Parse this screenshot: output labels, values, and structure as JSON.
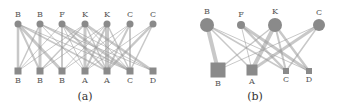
{
  "colors": {
    "node": "#8a8a8a",
    "edge": "#9a9a9a",
    "text": "#444444"
  },
  "panels": [
    {
      "id": "a",
      "caption": "(a)",
      "caption_pos": [
        85,
        100
      ],
      "top_nodes": [
        {
          "label": "B",
          "x": 18,
          "y": 24,
          "r": 3.5
        },
        {
          "label": "B",
          "x": 40,
          "y": 24,
          "r": 3.5
        },
        {
          "label": "F",
          "x": 62,
          "y": 24,
          "r": 3.5
        },
        {
          "label": "K",
          "x": 85,
          "y": 24,
          "r": 3.5
        },
        {
          "label": "K",
          "x": 107,
          "y": 24,
          "r": 3.5
        },
        {
          "label": "C",
          "x": 130,
          "y": 24,
          "r": 3.5
        },
        {
          "label": "C",
          "x": 153,
          "y": 24,
          "r": 3.5
        }
      ],
      "bottom_nodes": [
        {
          "label": "B",
          "x": 18,
          "y": 71,
          "s": 7
        },
        {
          "label": "B",
          "x": 40,
          "y": 71,
          "s": 7
        },
        {
          "label": "B",
          "x": 62,
          "y": 71,
          "s": 7
        },
        {
          "label": "A",
          "x": 85,
          "y": 71,
          "s": 7
        },
        {
          "label": "A",
          "x": 107,
          "y": 71,
          "s": 7
        },
        {
          "label": "C",
          "x": 130,
          "y": 71,
          "s": 7
        },
        {
          "label": "D",
          "x": 153,
          "y": 71,
          "s": 7
        }
      ],
      "edges": [
        [
          0,
          0,
          2.5
        ],
        [
          0,
          1,
          2
        ],
        [
          0,
          2,
          3
        ],
        [
          0,
          4,
          1.5
        ],
        [
          0,
          5,
          1
        ],
        [
          1,
          0,
          1.5
        ],
        [
          1,
          1,
          3
        ],
        [
          1,
          3,
          1
        ],
        [
          1,
          5,
          1.5
        ],
        [
          1,
          6,
          1
        ],
        [
          2,
          2,
          2
        ],
        [
          2,
          3,
          1
        ],
        [
          2,
          4,
          2
        ],
        [
          2,
          5,
          2.5
        ],
        [
          2,
          6,
          1
        ],
        [
          2,
          0,
          1
        ],
        [
          3,
          1,
          1.5
        ],
        [
          3,
          3,
          3
        ],
        [
          3,
          4,
          1.5
        ],
        [
          3,
          5,
          1
        ],
        [
          3,
          6,
          2.5
        ],
        [
          3,
          0,
          1
        ],
        [
          4,
          2,
          1
        ],
        [
          4,
          3,
          2
        ],
        [
          4,
          4,
          4
        ],
        [
          4,
          5,
          1.5
        ],
        [
          4,
          1,
          1
        ],
        [
          5,
          4,
          2
        ],
        [
          5,
          3,
          1
        ],
        [
          5,
          5,
          2
        ],
        [
          5,
          2,
          1
        ],
        [
          6,
          4,
          2.5
        ],
        [
          6,
          5,
          1.5
        ],
        [
          6,
          3,
          1
        ]
      ]
    },
    {
      "id": "b",
      "caption": "(b)",
      "caption_pos": [
        255,
        100
      ],
      "top_nodes": [
        {
          "label": "B",
          "x": 207,
          "y": 25,
          "r": 7
        },
        {
          "label": "F",
          "x": 241,
          "y": 25,
          "r": 4
        },
        {
          "label": "K",
          "x": 275,
          "y": 25,
          "r": 7
        },
        {
          "label": "C",
          "x": 319,
          "y": 25,
          "r": 6
        }
      ],
      "bottom_nodes": [
        {
          "label": "B",
          "x": 218,
          "y": 70,
          "s": 15
        },
        {
          "label": "A",
          "x": 252,
          "y": 70,
          "s": 11
        },
        {
          "label": "C",
          "x": 286,
          "y": 71,
          "s": 6
        },
        {
          "label": "D",
          "x": 309,
          "y": 71,
          "s": 6
        }
      ],
      "edges": [
        [
          0,
          0,
          4
        ],
        [
          0,
          1,
          1.5
        ],
        [
          0,
          2,
          1.5
        ],
        [
          0,
          3,
          1
        ],
        [
          1,
          1,
          1
        ],
        [
          1,
          2,
          2.5
        ],
        [
          1,
          3,
          3
        ],
        [
          2,
          0,
          1.5
        ],
        [
          2,
          1,
          4
        ],
        [
          2,
          2,
          2
        ],
        [
          2,
          3,
          2.5
        ],
        [
          3,
          1,
          3
        ],
        [
          3,
          2,
          1.5
        ],
        [
          3,
          0,
          1
        ]
      ]
    }
  ]
}
